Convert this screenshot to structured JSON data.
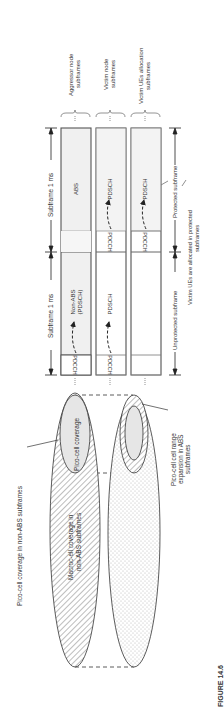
{
  "figure": {
    "caption": "FIGURE 14.6",
    "orientation": "rotated 90 degrees counter-clockwise"
  },
  "subframe_diagram": {
    "row_labels": [
      {
        "line1": "Aggressor node",
        "line2": "subframes"
      },
      {
        "line1": "Victim node",
        "line2": "subframes"
      },
      {
        "line1": "Victim UEs allocation",
        "line2": "subframes"
      }
    ],
    "timing": {
      "subframe_1": "Subframe 1 ms",
      "subframe_2": "Subframe 1 ms",
      "unprotected": "Unprotected subframe",
      "protected": "Protected subframe"
    },
    "subframes": [
      {
        "name": "unprotected",
        "cells": [
          {
            "row": "aggressor",
            "control": "PDCCH",
            "data_line1": "Non-ABS",
            "data_line2": "(PDSCH)"
          },
          {
            "row": "victim",
            "control": "PDCCH",
            "data_line1": "PDSCH",
            "data_line2": ""
          },
          {
            "row": "victim-ue",
            "control": "",
            "data_line1": "",
            "data_line2": ""
          }
        ]
      },
      {
        "name": "protected",
        "cells": [
          {
            "row": "aggressor",
            "control": "",
            "data_line1": "ABS",
            "data_line2": ""
          },
          {
            "row": "victim",
            "control": "PDCCH",
            "data_line1": "PDSCH",
            "data_line2": ""
          },
          {
            "row": "victim-ue",
            "control": "PDCCH",
            "data_line1": "PDSCH",
            "data_line2": ""
          }
        ]
      }
    ],
    "note": {
      "line1": "Victim UEs are allocated in protected",
      "line2": "subframes"
    }
  },
  "coverage_diagram": {
    "labels": {
      "pico_nonabs_outer": "Pico-cell coverage in non-ABS subframes",
      "pico_coverage": "Pico-cell coverage",
      "macro_line1": "Macroc-ell coverage in",
      "macro_line2": "non-ABS subframes",
      "cre_line1": "Pico-cell cell range",
      "cre_line2": "expansion in ABS",
      "cre_line3": "subframes"
    }
  },
  "colors": {
    "line": "#333333",
    "grey_fill": "#e4e4e4",
    "light_fill": "#f2f2f2",
    "hatch": "#9a9a9a",
    "dots": "#b5b5b5"
  }
}
